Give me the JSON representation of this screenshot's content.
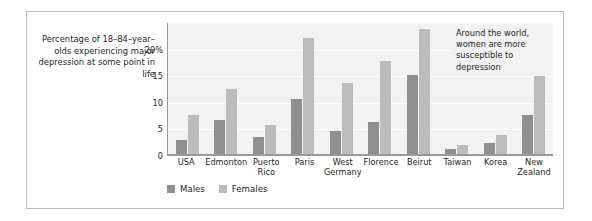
{
  "caption": "Percentage of 18–84–year–olds experiencing major depression at some point in life",
  "annotation": "Around the world, women are more susceptible to depression",
  "legend": [
    {
      "label": "Males",
      "color": "#8f8f8f"
    },
    {
      "label": "Females",
      "color": "#bcbcbc"
    }
  ],
  "chart_data": {
    "type": "bar",
    "title": "",
    "subtitle": "",
    "xlabel": "",
    "ylabel": "Percentage of 18–84–year–olds experiencing major depression at some point in life",
    "ylim": [
      0,
      25
    ],
    "yticks": [
      0,
      5,
      10,
      15,
      20
    ],
    "ytick_labels": [
      "0",
      "5",
      "10",
      "15",
      "20%"
    ],
    "grid": true,
    "legend_position": "bottom-left",
    "annotations": [
      "Around the world, women are more susceptible to depression"
    ],
    "categories": [
      "USA",
      "Edmonton",
      "Puerto Rico",
      "Paris",
      "West Germany",
      "Florence",
      "Beirut",
      "Taiwan",
      "Korea",
      "New Zealand"
    ],
    "series": [
      {
        "name": "Males",
        "color": "#8f8f8f",
        "values": [
          2.9,
          6.6,
          3.3,
          10.5,
          4.6,
          6.2,
          15.0,
          1.2,
          2.3,
          7.6
        ]
      },
      {
        "name": "Females",
        "color": "#bcbcbc",
        "values": [
          7.6,
          12.4,
          5.6,
          22.0,
          13.5,
          17.6,
          23.6,
          1.9,
          3.8,
          15.4
        ]
      }
    ]
  }
}
